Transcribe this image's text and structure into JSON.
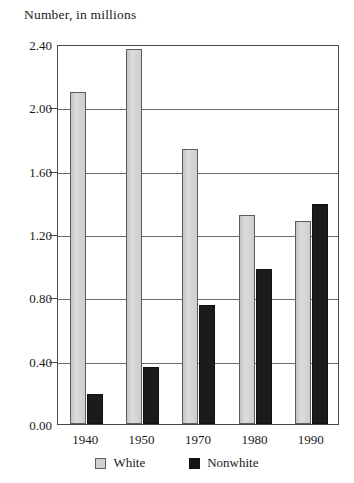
{
  "chart_data": {
    "type": "bar",
    "title": "Number, in millions",
    "xlabel": "",
    "ylabel": "",
    "ylim": [
      0.0,
      2.4
    ],
    "grid": true,
    "legend_position": "bottom",
    "categories": [
      "1940",
      "1950",
      "1970",
      "1980",
      "1990"
    ],
    "ytick_labels": [
      "2.40",
      "2.00",
      "1.60",
      "1.20",
      "0.80",
      "0.40",
      "0.00"
    ],
    "ytick_values": [
      2.4,
      2.0,
      1.6,
      1.2,
      0.8,
      0.4,
      0.0
    ],
    "series": [
      {
        "name": "White",
        "color": "#cfcfcf",
        "values": [
          2.1,
          2.37,
          1.74,
          1.32,
          1.28
        ]
      },
      {
        "name": "Nonwhite",
        "color": "#1b1b1b",
        "values": [
          0.19,
          0.36,
          0.75,
          0.98,
          1.39
        ]
      }
    ]
  },
  "legend": {
    "items": [
      {
        "label": "White",
        "swatch": "white-swatch-icon"
      },
      {
        "label": "Nonwhite",
        "swatch": "nonwhite-swatch-icon"
      }
    ]
  }
}
